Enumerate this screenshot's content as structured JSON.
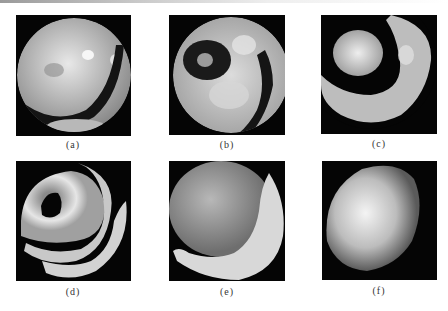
{
  "figure": {
    "panels": [
      {
        "id": "a",
        "label": "(a)",
        "description": "circular fringe image with bright mottled field and single dark curved fringe"
      },
      {
        "id": "b",
        "label": "(b)",
        "description": "circular fringe image with dark ring around bright spot and dark right arc"
      },
      {
        "id": "c",
        "label": "(c)",
        "description": "bright central blob surrounded by dark ring and bright crescent"
      },
      {
        "id": "d",
        "label": "(d)",
        "description": "dark hole center, bright ring, dark gaps and outer bright arcs"
      },
      {
        "id": "e",
        "label": "(e)",
        "description": "large gray disc with bright crescent at lower right"
      },
      {
        "id": "f",
        "label": "(f)",
        "description": "single bright smooth disc with no fringes"
      }
    ]
  }
}
